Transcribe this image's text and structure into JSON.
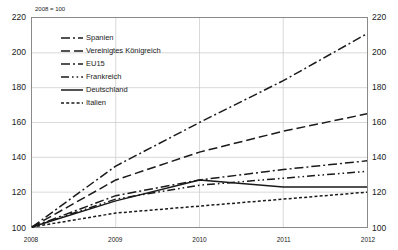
{
  "chart_data": {
    "type": "line",
    "title": "",
    "subtitle": "",
    "base_note": "2008 = 100",
    "xlabel": "",
    "ylabel": "",
    "x": [
      2008,
      2009,
      2010,
      2011,
      2012
    ],
    "xtick_labels": [
      "2008",
      "2009",
      "2010",
      "2011",
      "2012"
    ],
    "ytick_labels": [
      "100",
      "120",
      "140",
      "160",
      "180",
      "200",
      "220"
    ],
    "yticks": [
      100,
      120,
      140,
      160,
      180,
      200,
      220
    ],
    "ylim": [
      100,
      220
    ],
    "xlim": [
      2008,
      2012
    ],
    "grid": true,
    "grid_axis": "both",
    "legend_position": "upper-left-inside",
    "dual_y_axis": true,
    "series": [
      {
        "name": "Spanien",
        "style": "dash-dot",
        "color": "#1a1a1a",
        "values": [
          100,
          135,
          160,
          184,
          211
        ]
      },
      {
        "name": "Vereinigtes Königreich",
        "style": "long-dash",
        "color": "#1a1a1a",
        "values": [
          100,
          127,
          143,
          155,
          165
        ]
      },
      {
        "name": "EU15",
        "style": "dash-dot",
        "color": "#1a1a1a",
        "values": [
          100,
          118,
          127,
          133,
          138
        ]
      },
      {
        "name": "Frankreich",
        "style": "dash-dot-dot",
        "color": "#1a1a1a",
        "values": [
          100,
          116,
          124,
          128,
          132
        ]
      },
      {
        "name": "Deutschland",
        "style": "solid",
        "color": "#1a1a1a",
        "values": [
          100,
          115,
          127,
          123,
          123
        ]
      },
      {
        "name": "Italien",
        "style": "short-dash",
        "color": "#1a1a1a",
        "values": [
          100,
          108,
          112,
          116,
          120
        ]
      }
    ]
  },
  "caption": ""
}
